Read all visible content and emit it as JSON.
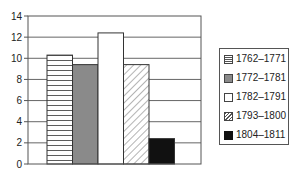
{
  "chart_data": {
    "type": "bar",
    "title": "",
    "xlabel": "",
    "ylabel": "",
    "categories": [
      "1762–1771",
      "1772–1781",
      "1782–1791",
      "1793–1800",
      "1804–1811"
    ],
    "values": [
      10.3,
      9.4,
      12.4,
      9.4,
      2.4
    ],
    "ylim": [
      0,
      14
    ],
    "yticks": [
      0,
      2,
      4,
      6,
      8,
      10,
      12,
      14
    ],
    "grid": true,
    "legend_position": "right",
    "series_styles": [
      {
        "name": "1762–1771",
        "pattern": "horizontal-lines",
        "color": "#ffffff"
      },
      {
        "name": "1772–1781",
        "pattern": "solid",
        "color": "#8a8a8a"
      },
      {
        "name": "1782–1791",
        "pattern": "solid",
        "color": "#ffffff"
      },
      {
        "name": "1793–1800",
        "pattern": "diagonal-hatch",
        "color": "#ffffff"
      },
      {
        "name": "1804–1811",
        "pattern": "solid",
        "color": "#111111"
      }
    ]
  },
  "legend": {
    "items": [
      {
        "label": "1762–1771"
      },
      {
        "label": "1772–1781"
      },
      {
        "label": "1782–1791"
      },
      {
        "label": "1793–1800"
      },
      {
        "label": "1804–1811"
      }
    ]
  },
  "axis": {
    "y_tick_labels": [
      "0",
      "2",
      "4",
      "6",
      "8",
      "10",
      "12",
      "14"
    ]
  }
}
